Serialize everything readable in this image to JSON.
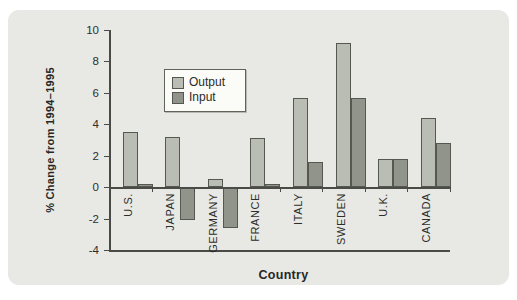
{
  "chart_data": {
    "type": "bar",
    "title": "",
    "xlabel": "Country",
    "ylabel": "% Change from 1994–1995",
    "categories": [
      "U.S.",
      "JAPAN",
      "GERMANY",
      "FRANCE",
      "ITALY",
      "SWEDEN",
      "U.K.",
      "CANADA"
    ],
    "series": [
      {
        "name": "Output",
        "color": "#b9bdb3",
        "values": [
          3.5,
          3.2,
          0.5,
          3.1,
          5.7,
          9.2,
          1.8,
          4.4
        ]
      },
      {
        "name": "Input",
        "color": "#90948b",
        "values": [
          0.2,
          -2.1,
          -2.6,
          0.2,
          1.6,
          5.7,
          1.8,
          2.8
        ]
      }
    ],
    "ylim": [
      -4,
      10
    ],
    "ytick_step": 2,
    "yticks": [
      10,
      8,
      6,
      4,
      2,
      0,
      -2,
      -4
    ],
    "grid": false,
    "legend_position": "upper-left-inside",
    "bar_border_color": "#55584f",
    "panel_background": "#e8e9e4",
    "axis_color": "#4a4a46"
  }
}
